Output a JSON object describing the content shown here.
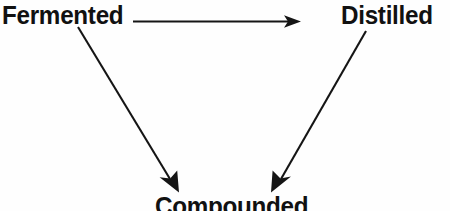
{
  "diagram": {
    "background_color": "#fefefe",
    "ink_color": "#151515",
    "nodes": [
      {
        "id": "fermented",
        "label": "Fermented",
        "position": "top-left"
      },
      {
        "id": "distilled",
        "label": "Distilled",
        "position": "top-right"
      },
      {
        "id": "compounded",
        "label": "Compounded",
        "position": "bottom-center",
        "clipped": "true"
      }
    ],
    "edges": [
      {
        "id": "fermented-to-distilled",
        "from": "Fermented",
        "to": "Distilled",
        "style": "solid-arrow",
        "direction": "horizontal-right"
      },
      {
        "id": "fermented-to-compounded",
        "from": "Fermented",
        "to": "Compounded",
        "style": "solid-arrow",
        "direction": "diagonal-down-right"
      },
      {
        "id": "distilled-to-compounded",
        "from": "Distilled",
        "to": "Compounded",
        "style": "solid-arrow",
        "direction": "diagonal-down-left"
      }
    ]
  }
}
